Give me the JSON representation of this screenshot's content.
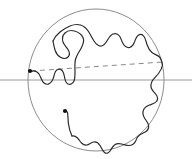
{
  "figure": {
    "title": "Random curve in a disk with chord",
    "type": "mathematical-diagram",
    "width": 192,
    "height": 159,
    "background_color": "#ffffff"
  },
  "colors": {
    "circle_stroke": "#8c8c8c",
    "axis_stroke": "#9a9a9a",
    "dashed_stroke": "#8a8a8a",
    "curve_stroke": "#2b2b2b",
    "marker_fill": "#111111"
  },
  "circle": {
    "label": "unit-disk-boundary",
    "center_x": 96,
    "center_y": 80,
    "radius_x": 68,
    "radius_y": 71,
    "stroke_width": 1
  },
  "axis_line": {
    "label": "horizontal-axis",
    "x1": 0,
    "y1": 80,
    "x2": 192,
    "y2": 80,
    "stroke_width": 1
  },
  "chord": {
    "label": "dashed-chord",
    "x1": 31,
    "y1": 71,
    "x2": 163,
    "y2": 62,
    "dash_pattern": "5,4",
    "stroke_width": 1
  },
  "markers": [
    {
      "name": "start-point-left",
      "cx": 30,
      "cy": 71,
      "r": 2.1
    },
    {
      "name": "start-point-lower",
      "cx": 65,
      "cy": 111,
      "r": 2.1
    }
  ],
  "curves": [
    {
      "name": "random-curve-upper",
      "path": "M30.5,71.5 C34,70 37,71 39,74 C41,77 41.5,81 44,83 C47,85.5 50,84 52,81 C54,78 54,74 55.5,71.5 C57,69 59.5,68.5 61.5,70 C63.5,71.5 64,74 64.5,77 C65,80 65.5,83 68,84 C70.5,85 73,83.5 74,81 C75,78.5 75,75.5 75,72.5 C75,68 74.5,63.5 75.5,59.5 C76.5,55.5 79,52 81,48.5 C83,45 84.5,41 83,37.5 C81.5,34 78,32 74.5,31 C71,30 67.5,30.5 65,33 C62.5,35.5 62,39 63,42 C64,45 66.5,47 68,49.5 C69.5,52 70,55 68,57 C66,59 62.5,58.5 60,57 C57.5,55.5 56,53 55,50 C54,47 53.5,44 53,41"
    },
    {
      "name": "random-curve-upper-right",
      "path": "M53,41 C54.5,37.5 57,34.5 60,32 C63,29.5 66.5,27.5 70,26 C73.5,24.5 77,24 80.5,25 C84,26 86.5,28.5 88.5,31.5 C90.5,34.5 92,38 94,41 C96,44 98.5,46.5 101.5,46 C104.5,45.5 106,42.5 107.5,40 C109,37.5 110.5,35 113,34 C115.5,33 118,34 119.5,36 C121,38 121.5,41 123,43.5 C124.5,46 127,48 129.5,47.5 C132,47 133.5,44.5 134.5,42 C135.5,39.5 136,37 138,35.5 C140,34 142.5,34.5 144,36.5 C145.5,38.5 146,41.5 147,44.5 C148,47.5 149.5,50.5 152,52.5 C154.5,54.5 157.5,55 159.5,57 C161.5,59 162,62 162.5,65"
    },
    {
      "name": "random-curve-right-descending",
      "path": "M162.5,65 C162,68 160.5,71 158.5,73.5 C156.5,76 154,78 152.5,80.5 C151,83 150.5,86 151.5,88.5 C152.5,91 154.5,92.5 156,94.5 C157.5,96.5 158,99.5 156.5,101.5 C155,103.5 152,104 149.5,105 C147,106 144.5,107.5 143.5,110 C142.5,112.5 143,115.5 144.5,118 C146,120.5 148,122.5 148.5,125 C149,127.5 148,130 146,131.5 C144,133 141.5,133.5 139.5,135 C137.5,136.5 136,139 135.5,141.5"
    },
    {
      "name": "random-curve-bottom",
      "path": "M135.5,141.5 C134,144 131.5,145.5 129,145.5 C126.5,145.5 124,144.5 121.5,144 C119,143.5 116.5,143.5 114.5,145 C112.5,146.5 111.5,149 110,151 C108.5,153 106.5,154 104.5,152.5 C102.5,151 101.5,148 100,145.5 C98.5,143 96,141.5 93.5,142 C91,142.5 89,144.5 87,145 C85,145.5 83,144.5 81.5,143 C80,141.5 79,139.5 77.5,138 C76,136.5 74,135.5 72,136"
    },
    {
      "name": "random-curve-lower-left-tail",
      "path": "M72,136 C70,132 69,128 68.5,124 C68,120 68,116 67.5,112.5 C67.2,111.8 66.5,111.3 65.5,111.2"
    }
  ],
  "legend": {
    "visible": false,
    "items": []
  },
  "annotations": []
}
